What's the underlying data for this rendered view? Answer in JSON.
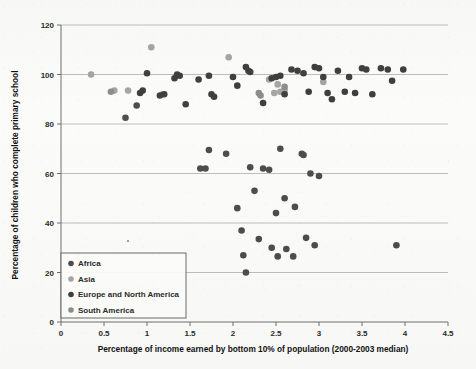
{
  "chart_data": {
    "type": "scatter",
    "title": "",
    "xlabel": "Percentage of income earned by bottom 10% of population (2000-2003 median)",
    "ylabel": "Percentage of children who complete primary school",
    "xlim": [
      0,
      4.5
    ],
    "ylim": [
      0,
      120
    ],
    "xticks": [
      "0",
      "0.5",
      "1",
      "1.5",
      "2",
      "2.5",
      "3",
      "3.5",
      "4",
      "4.5"
    ],
    "xtick_values": [
      0,
      0.5,
      1,
      1.5,
      2,
      2.5,
      3,
      3.5,
      4,
      4.5
    ],
    "yticks": [
      "0",
      "20",
      "40",
      "60",
      "80",
      "100",
      "120"
    ],
    "ytick_values": [
      0,
      20,
      40,
      60,
      80,
      100,
      120
    ],
    "grid": "horizontal",
    "legend_position": "bottom-left",
    "marker_colors": {
      "africa": "#4d4d4d",
      "asia": "#a5a5a5",
      "europe_and_north_america": "#3f3f3f",
      "south_america": "#8d8d8d"
    },
    "series": [
      {
        "name": "Africa",
        "color": "#4d4d4d",
        "points": [
          [
            2.05,
            46.0
          ],
          [
            2.1,
            37.0
          ],
          [
            2.12,
            27.0
          ],
          [
            2.15,
            20.0
          ],
          [
            2.2,
            62.5
          ],
          [
            2.25,
            53.0
          ],
          [
            2.3,
            33.5
          ],
          [
            2.35,
            62.0
          ],
          [
            2.42,
            61.5
          ],
          [
            2.45,
            30.0
          ],
          [
            2.5,
            44.0
          ],
          [
            2.52,
            26.5
          ],
          [
            2.55,
            70.0
          ],
          [
            2.6,
            50.0
          ],
          [
            2.62,
            29.5
          ],
          [
            2.7,
            26.5
          ],
          [
            2.72,
            46.5
          ],
          [
            2.8,
            68.0
          ],
          [
            2.82,
            67.5
          ],
          [
            2.85,
            34.0
          ],
          [
            2.9,
            60.0
          ],
          [
            2.95,
            31.0
          ],
          [
            3.0,
            59.0
          ],
          [
            3.9,
            31.0
          ],
          [
            1.72,
            69.5
          ],
          [
            1.92,
            68.0
          ],
          [
            0.75,
            82.5
          ],
          [
            0.88,
            87.5
          ],
          [
            1.62,
            62.0
          ],
          [
            1.68,
            62.0
          ]
        ]
      },
      {
        "name": "Asia",
        "color": "#a5a5a5",
        "points": [
          [
            0.35,
            100.0
          ],
          [
            0.62,
            93.5
          ],
          [
            0.78,
            93.5
          ],
          [
            1.05,
            111.0
          ],
          [
            1.95,
            107.0
          ],
          [
            2.42,
            98.0
          ],
          [
            2.52,
            96.0
          ],
          [
            2.6,
            93.5
          ],
          [
            3.05,
            97.0
          ],
          [
            2.55,
            93.0
          ],
          [
            1.18,
            92.0
          ],
          [
            2.48,
            92.5
          ]
        ]
      },
      {
        "name": "Europe and North America",
        "color": "#3f3f3f",
        "points": [
          [
            1.0,
            100.5
          ],
          [
            1.32,
            98.5
          ],
          [
            1.35,
            100.0
          ],
          [
            1.38,
            99.5
          ],
          [
            1.6,
            98.0
          ],
          [
            1.72,
            99.5
          ],
          [
            1.75,
            92.0
          ],
          [
            1.78,
            91.0
          ],
          [
            2.0,
            99.0
          ],
          [
            2.05,
            95.5
          ],
          [
            2.15,
            103.0
          ],
          [
            2.18,
            101.5
          ],
          [
            2.2,
            101.0
          ],
          [
            2.35,
            88.5
          ],
          [
            2.45,
            98.5
          ],
          [
            2.5,
            99.0
          ],
          [
            2.55,
            99.5
          ],
          [
            2.6,
            92.0
          ],
          [
            2.68,
            102.0
          ],
          [
            2.75,
            101.5
          ],
          [
            2.82,
            100.5
          ],
          [
            2.88,
            93.0
          ],
          [
            2.95,
            103.0
          ],
          [
            3.0,
            102.5
          ],
          [
            3.05,
            99.0
          ],
          [
            3.1,
            92.5
          ],
          [
            3.15,
            90.0
          ],
          [
            3.22,
            101.5
          ],
          [
            3.3,
            93.0
          ],
          [
            3.35,
            99.0
          ],
          [
            3.42,
            92.5
          ],
          [
            3.5,
            102.5
          ],
          [
            3.55,
            102.0
          ],
          [
            3.62,
            92.0
          ],
          [
            3.72,
            102.5
          ],
          [
            3.8,
            102.0
          ],
          [
            3.85,
            97.5
          ],
          [
            3.98,
            102.0
          ],
          [
            1.15,
            91.5
          ],
          [
            1.2,
            92.0
          ],
          [
            0.92,
            92.5
          ],
          [
            0.95,
            93.5
          ],
          [
            1.45,
            88.0
          ]
        ]
      },
      {
        "name": "South America",
        "color": "#8d8d8d",
        "points": [
          [
            2.3,
            92.5
          ],
          [
            2.32,
            91.5
          ],
          [
            2.6,
            95.0
          ],
          [
            0.58,
            93.0
          ]
        ]
      }
    ]
  },
  "legend": {
    "items": [
      {
        "label": "Africa",
        "color": "#4d4d4d"
      },
      {
        "label": "Asia",
        "color": "#a5a5a5"
      },
      {
        "label": "Europe and North America",
        "color": "#3f3f3f"
      },
      {
        "label": "South America",
        "color": "#8d8d8d"
      }
    ]
  }
}
